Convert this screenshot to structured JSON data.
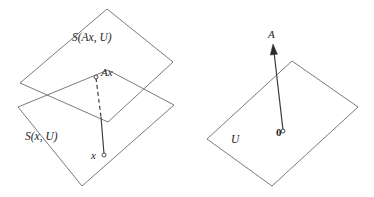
{
  "figure": {
    "background_color": "#ffffff",
    "stroke_color": "#6b6b6b",
    "line_color": "#3a3a3a",
    "text_color": "#1d1d1d",
    "width": 374,
    "height": 197,
    "left_diagram": {
      "upper_plane_label": "S(Ax, U)",
      "lower_plane_label": "S(x, U)",
      "upper_point_label": "Ax",
      "lower_point_label": "x",
      "upper_plane_vertices": "107,9 173,62 108,122 20,83",
      "lower_plane_vertices": "108,70 174,105 82,186 18,107",
      "connector_dashed": "96,78 101,117",
      "connector_solid": "101,117 104,154",
      "upper_point": {
        "x": 96,
        "y": 77
      },
      "lower_point": {
        "x": 104,
        "y": 155
      }
    },
    "right_diagram": {
      "plane_label": "U",
      "vector_label": "A",
      "origin_label": "0",
      "plane_vertices": "292,61 358,107 272,186 207,139",
      "vector_line": "283,130 274,52",
      "origin_point": {
        "x": 283,
        "y": 131
      },
      "arrow_tip": {
        "x": 273,
        "y": 45
      }
    }
  }
}
